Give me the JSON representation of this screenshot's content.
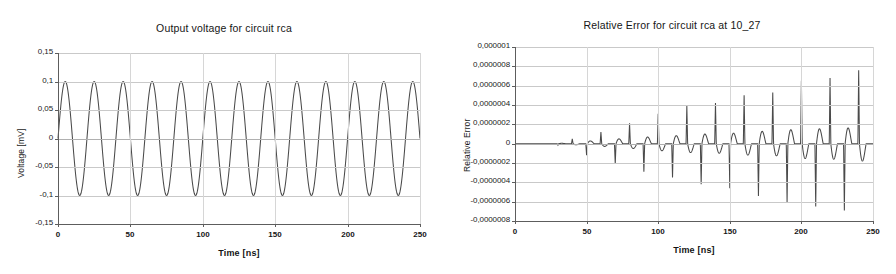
{
  "figure": {
    "background": "#ffffff",
    "line_color": "#4a4a4a",
    "grid_color": "#c9c9c9"
  },
  "panels": {
    "left": {
      "title": "Output voltage for circuit rca",
      "xlabel": "Time [ns]",
      "ylabel": "Voltage [mV]",
      "yticks": [
        "0,15",
        "0,1",
        "0,05",
        "0",
        "-0,05",
        "-0,1",
        "-0,15"
      ],
      "xticks": [
        "0",
        "50",
        "100",
        "150",
        "200",
        "250"
      ]
    },
    "right": {
      "title": "Relative Error for circuit rca at 10_27",
      "xlabel": "Time [ns]",
      "ylabel": "Relative Error",
      "yticks": [
        "0,000001",
        "0,0000008",
        "0,0000006",
        "0,0000004",
        "0,0000002",
        "0",
        "-0,0000002",
        "-0,0000004",
        "-0,0000006",
        "-0,0000008"
      ],
      "xticks": [
        "0",
        "50",
        "100",
        "150",
        "200",
        "250"
      ]
    }
  },
  "chart_data": [
    {
      "type": "line",
      "title": "Output voltage for circuit rca",
      "xlabel": "Time [ns]",
      "ylabel": "Voltage [mV]",
      "xlim": [
        0,
        250
      ],
      "ylim": [
        -0.15,
        0.15
      ],
      "ytick_values": [
        0.15,
        0.1,
        0.05,
        0,
        -0.05,
        -0.1,
        -0.15
      ],
      "xtick_values": [
        0,
        50,
        100,
        150,
        200,
        250
      ],
      "grid": true,
      "legend": "none",
      "series": [
        {
          "name": "Output voltage",
          "waveform": "sine",
          "amplitude": 0.1,
          "period_ns": 20,
          "phase_deg": 0,
          "offset": 0,
          "cycles": 12.5,
          "description": "Sinusoid peaking at +0,1 mV and -0,1 mV, starting at 0 at t=0 ns, 12.5 full cycles across 0-250 ns"
        }
      ]
    },
    {
      "type": "line",
      "title": "Relative Error for circuit rca at 10_27",
      "xlabel": "Time [ns]",
      "ylabel": "Relative Error",
      "xlim": [
        0,
        250
      ],
      "ylim": [
        -8e-07,
        1e-06
      ],
      "ytick_values": [
        1e-06,
        8e-07,
        6e-07,
        4e-07,
        2e-07,
        0,
        -2e-07,
        -4e-07,
        -6e-07,
        -8e-07
      ],
      "xtick_values": [
        0,
        50,
        100,
        150,
        200,
        250
      ],
      "grid": true,
      "legend": "none",
      "series": [
        {
          "name": "Relative Error",
          "description": "Near-zero baseline with alternating positive and negative spikes every 10 ns, amplitude growing monotonically with time",
          "spikes": [
            {
              "t": 30,
              "peak": -1.5e-08
            },
            {
              "t": 40,
              "peak": 5e-08
            },
            {
              "t": 50,
              "peak": -1.2e-07
            },
            {
              "t": 60,
              "peak": 1.2e-07
            },
            {
              "t": 70,
              "peak": -2.1e-07
            },
            {
              "t": 80,
              "peak": 2.1e-07
            },
            {
              "t": 90,
              "peak": -2.9e-07
            },
            {
              "t": 100,
              "peak": 3.1e-07
            },
            {
              "t": 110,
              "peak": -3.5e-07
            },
            {
              "t": 120,
              "peak": 3.9e-07
            },
            {
              "t": 130,
              "peak": -4.2e-07
            },
            {
              "t": 140,
              "peak": 4.2e-07
            },
            {
              "t": 150,
              "peak": -4.6e-07
            },
            {
              "t": 160,
              "peak": 5e-07
            },
            {
              "t": 170,
              "peak": -5.4e-07
            },
            {
              "t": 180,
              "peak": 5.3e-07
            },
            {
              "t": 190,
              "peak": -6.1e-07
            },
            {
              "t": 200,
              "peak": 6.5e-07
            },
            {
              "t": 210,
              "peak": -6.5e-07
            },
            {
              "t": 220,
              "peak": 6.8e-07
            },
            {
              "t": 230,
              "peak": -6.9e-07
            },
            {
              "t": 240,
              "peak": 7.6e-07
            }
          ]
        }
      ]
    }
  ]
}
